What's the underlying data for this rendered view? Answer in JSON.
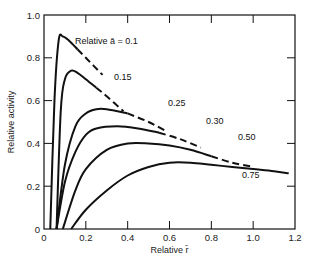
{
  "chart_data": {
    "type": "line",
    "title": "",
    "xlabel": "Relative r̄",
    "ylabel": "Relative activity",
    "xlim": [
      0,
      1.2
    ],
    "ylim": [
      0,
      1.0
    ],
    "xticks": [
      "0",
      "0.2",
      "0.4",
      "0.6",
      "0.8",
      "1.0",
      "1.2"
    ],
    "yticks": [
      "0",
      "0.2",
      "0.4",
      "0.6",
      "0.8",
      "1.0"
    ],
    "grid": false,
    "legend": "inline labels",
    "series": [
      {
        "name": "Relative ā = 0.1",
        "label": "Relative ā = 0.1",
        "x": [
          0.03,
          0.05,
          0.07,
          0.09,
          0.12,
          0.16,
          0.2,
          0.24,
          0.28
        ],
        "y": [
          0,
          0.6,
          0.88,
          0.9,
          0.88,
          0.84,
          0.8,
          0.76,
          0.72
        ],
        "dashed_from": 0.2
      },
      {
        "name": "0.15",
        "label": "0.15",
        "x": [
          0.06,
          0.08,
          0.1,
          0.13,
          0.16,
          0.2,
          0.25,
          0.3,
          0.38
        ],
        "y": [
          0,
          0.55,
          0.7,
          0.74,
          0.73,
          0.7,
          0.66,
          0.62,
          0.55
        ],
        "dashed_from": 0.3
      },
      {
        "name": "0.25",
        "label": "0.25",
        "x": [
          0.06,
          0.1,
          0.15,
          0.2,
          0.25,
          0.3,
          0.4,
          0.5,
          0.58
        ],
        "y": [
          0,
          0.3,
          0.48,
          0.54,
          0.56,
          0.56,
          0.54,
          0.5,
          0.46
        ],
        "dashed_from": 0.48
      },
      {
        "name": "0.30",
        "label": "0.30",
        "x": [
          0.06,
          0.1,
          0.15,
          0.2,
          0.25,
          0.35,
          0.45,
          0.55,
          0.65,
          0.75
        ],
        "y": [
          0,
          0.22,
          0.36,
          0.44,
          0.47,
          0.48,
          0.47,
          0.45,
          0.42,
          0.38
        ],
        "dashed_from": 0.65
      },
      {
        "name": "0.50",
        "label": "0.50",
        "x": [
          0.09,
          0.15,
          0.2,
          0.3,
          0.4,
          0.5,
          0.6,
          0.7,
          0.8,
          0.9,
          1.0
        ],
        "y": [
          0,
          0.18,
          0.28,
          0.37,
          0.4,
          0.4,
          0.39,
          0.37,
          0.34,
          0.31,
          0.29
        ],
        "dashed_from": 0.88
      },
      {
        "name": "0.75",
        "label": "0.75",
        "x": [
          0.13,
          0.2,
          0.3,
          0.4,
          0.5,
          0.6,
          0.7,
          0.8,
          0.9,
          1.0,
          1.1,
          1.17
        ],
        "y": [
          0,
          0.09,
          0.18,
          0.25,
          0.29,
          0.31,
          0.31,
          0.3,
          0.29,
          0.28,
          0.27,
          0.26
        ],
        "dashed_from": null
      }
    ]
  }
}
